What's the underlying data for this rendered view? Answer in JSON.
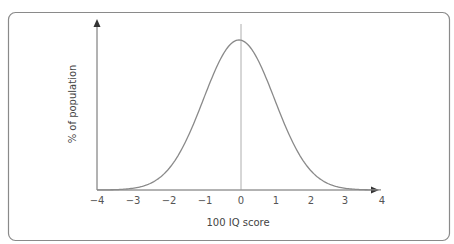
{
  "chart_data": {
    "type": "line",
    "title": "",
    "xlabel": "100 IQ score",
    "ylabel": "% of population",
    "x_ticks": [
      "−4",
      "−3",
      "−2",
      "−1",
      "0",
      "1",
      "2",
      "3",
      "4"
    ],
    "xlim": [
      -4,
      4
    ],
    "grid": false,
    "legend": null,
    "series": [
      {
        "name": "normal distribution",
        "x": [
          -4,
          -3.5,
          -3,
          -2.5,
          -2,
          -1.5,
          -1,
          -0.5,
          0,
          0.5,
          1,
          1.5,
          2,
          2.5,
          3,
          3.5,
          4
        ],
        "values": [
          0.0003,
          0.0022,
          0.011,
          0.044,
          0.135,
          0.325,
          0.607,
          0.882,
          1.0,
          0.882,
          0.607,
          0.325,
          0.135,
          0.044,
          0.011,
          0.0022,
          0.0003
        ]
      }
    ],
    "annotations": [
      "vertical line at x = 0 (mean)"
    ]
  },
  "colors": {
    "frame": "#8a8a8a",
    "axis": "#666666",
    "curve": "#8a8a8a",
    "text": "#555555"
  }
}
